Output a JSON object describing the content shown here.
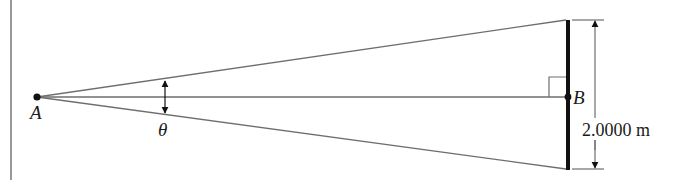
{
  "diagram": {
    "type": "geometry",
    "points": {
      "A": {
        "label": "A",
        "x": 37,
        "y": 97
      },
      "B": {
        "label": "B",
        "x": 568,
        "y": 97
      }
    },
    "angle_label": "θ",
    "dimension_label": "2.0000 m",
    "colors": {
      "lines": "#6e6e6e",
      "rod": "#111111",
      "text": "#1a1a1a",
      "border": "#777777"
    }
  }
}
